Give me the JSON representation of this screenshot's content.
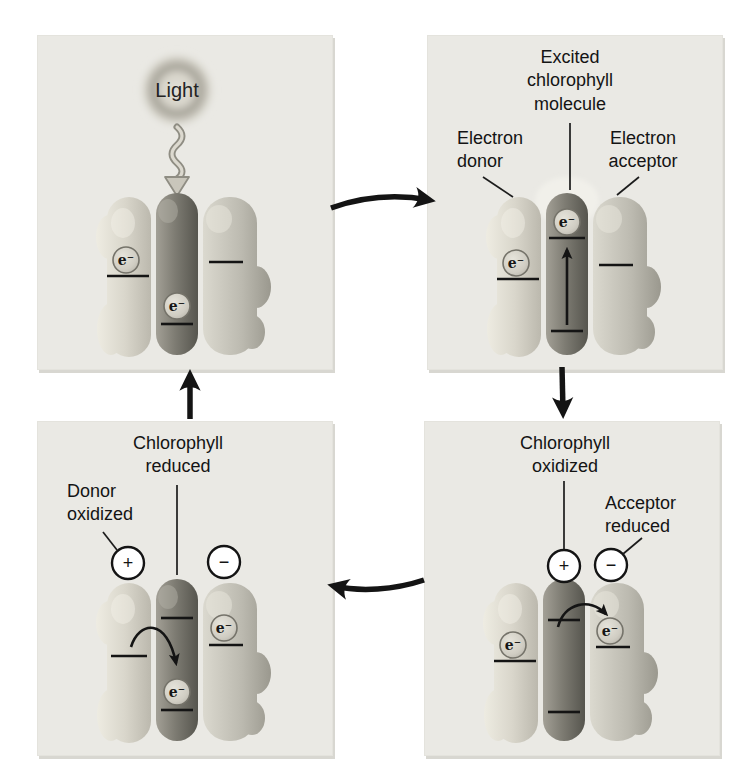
{
  "figure": {
    "panels": {
      "top_left": {
        "light_label": "Light",
        "electron_symbol": "e⁻"
      },
      "top_right": {
        "excited_label": "Excited\nchlorophyll\nmolecule",
        "donor_label": "Electron\ndonor",
        "acceptor_label": "Electron\nacceptor",
        "electron_symbol": "e⁻"
      },
      "bottom_right": {
        "chlorophyll_label": "Chlorophyll\noxidized",
        "acceptor_label": "Acceptor\nreduced",
        "plus_symbol": "+",
        "minus_symbol": "−",
        "electron_symbol": "e⁻"
      },
      "bottom_left": {
        "chlorophyll_label": "Chlorophyll\nreduced",
        "donor_label": "Donor\noxidized",
        "plus_symbol": "+",
        "minus_symbol": "−",
        "electron_symbol": "e⁻"
      }
    },
    "colors": {
      "page_background": "#ffffff",
      "panel_background": "#eae9e4",
      "panel_shadow": "#d8d7d1",
      "arrow_color": "#141414",
      "label_text": "#141414",
      "donor_molecule": "#d9d6cb",
      "chlorophyll_molecule": "#7e7c73",
      "acceptor_molecule": "#bcbab0",
      "electron_fill": "#d5d2c8",
      "charge_circle_fill": "#ffffff"
    }
  }
}
